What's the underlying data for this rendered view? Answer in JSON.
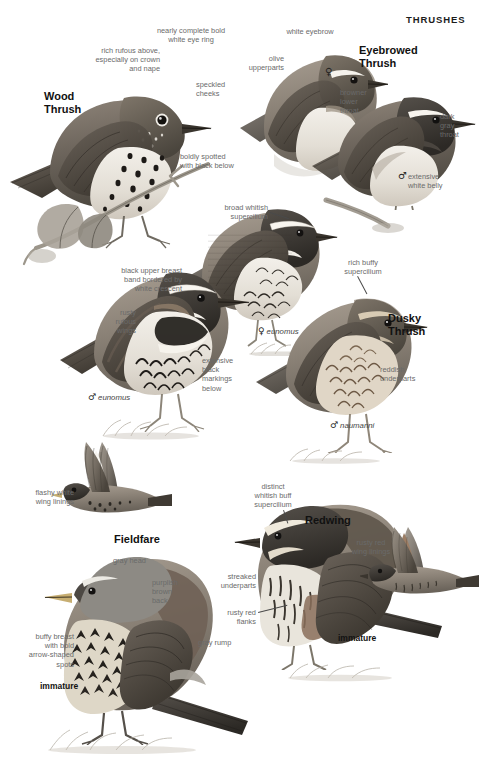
{
  "page": {
    "header": "THRUSHES",
    "width": 480,
    "height": 766,
    "background": "#ffffff",
    "annotation_color": "#6a6a6a",
    "heading_color": "#111111"
  },
  "species": [
    {
      "id": "wood-thrush",
      "name": "Wood\nThrush",
      "annotations": [
        "rich rufous above,\nespecially on crown\nand nape",
        "nearly complete bold\nwhite eye ring",
        "speckled\ncheeks",
        "boldly spotted\nwith black below"
      ]
    },
    {
      "id": "eyebrowed-thrush",
      "name": "Eyebrowed\nThrush",
      "annotations": [
        "white eyebrow",
        "olive\nupperparts",
        "browner\nlower\nthroat",
        "dark\ngray\nthroat",
        "extensive\nwhite belly"
      ],
      "sex_marks": [
        "female",
        "male"
      ]
    },
    {
      "id": "dusky-thrush",
      "name": "Dusky\nThrush",
      "annotations": [
        "broad whitish\nsupercilium",
        "black upper breast\nband bordered by\nwhite crescent",
        "rusty\nrufous\nwings",
        "extensive\nblack\nmarkings\nbelow",
        "rich buffy\nsupercilium",
        "reddish\nunderparts"
      ],
      "subspecies": [
        {
          "sex": "male",
          "name": "eunomus"
        },
        {
          "sex": "female",
          "name": "eunomus"
        },
        {
          "sex": "male",
          "name": "naumanni"
        }
      ]
    },
    {
      "id": "fieldfare",
      "name": "Fieldfare",
      "annotations": [
        "flashy white\nwing linings",
        "gray head",
        "purplish\nbrown\nback",
        "gray rump",
        "buffy breast\nwith bold\narrow-shaped\nspots"
      ],
      "age_labels": [
        "immature"
      ]
    },
    {
      "id": "redwing",
      "name": "Redwing",
      "annotations": [
        "distinct\nwhitish buff\nsupercilium",
        "streaked\nunderparts",
        "rusty red\nflanks",
        "rusty red\nwing linings"
      ],
      "age_labels": [
        "immature"
      ]
    }
  ],
  "labels": {
    "header": "THRUSHES",
    "wood_thrush_name": "Wood\nThrush",
    "wood_rufous": "rich rufous above,\nespecially on crown\nand nape",
    "wood_eyering": "nearly complete bold\nwhite eye ring",
    "wood_cheeks": "speckled\ncheeks",
    "wood_spotted": "boldly spotted\nwith black below",
    "eyebrowed_name": "Eyebrowed\nThrush",
    "eyebrowed_eyebrow": "white eyebrow",
    "eyebrowed_olive": "olive\nupperparts",
    "eyebrowed_browner": "browner\nlower\nthroat",
    "eyebrowed_darkgray": "dark\ngray\nthroat",
    "eyebrowed_belly": "extensive\nwhite belly",
    "eyebrowed_female_sym": "♀",
    "eyebrowed_male_sym": "♂",
    "dusky_name": "Dusky\nThrush",
    "dusky_supercilium": "broad whitish\nsupercilium",
    "dusky_breastband": "black upper breast\nband bordered by\nwhite crescent",
    "dusky_wings": "rusty\nrufous\nwings",
    "dusky_markings": "extensive\nblack\nmarkings\nbelow",
    "dusky_buffy": "rich buffy\nsupercilium",
    "dusky_reddish": "reddish\nunderparts",
    "dusky_male_eunomus_sym": "♂",
    "dusky_male_eunomus_name": "eunomus",
    "dusky_female_eunomus_sym": "♀",
    "dusky_female_eunomus_name": "eunomus",
    "dusky_male_naumanni_sym": "♂",
    "dusky_male_naumanni_name": "naumanni",
    "fieldfare_name": "Fieldfare",
    "fieldfare_winglinings": "flashy white\nwing linings",
    "fieldfare_grayhead": "gray head",
    "fieldfare_back": "purplish\nbrown\nback",
    "fieldfare_rump": "gray rump",
    "fieldfare_breast": "buffy breast\nwith bold\narrow-shaped\nspots",
    "fieldfare_immature": "immature",
    "redwing_name": "Redwing",
    "redwing_supercilium": "distinct\nwhitish buff\nsupercilium",
    "redwing_streaked": "streaked\nunderparts",
    "redwing_flanks": "rusty red\nflanks",
    "redwing_winglinings": "rusty red\nwing linings",
    "redwing_immature": "immature"
  }
}
